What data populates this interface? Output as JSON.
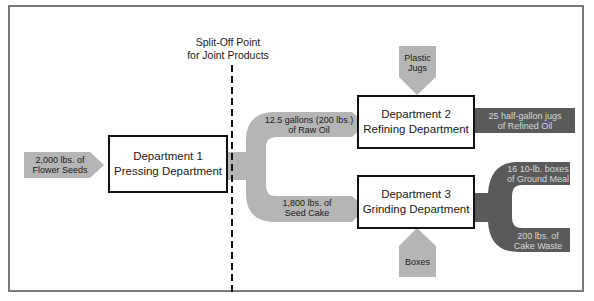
{
  "colors": {
    "light_flow": "#b5b5b5",
    "dark_flow": "#5a5a5a",
    "box_border": "#111111",
    "frame": "#7a7a7a"
  },
  "split_off": {
    "line1": "Split-Off Point",
    "line2": "for Joint Products"
  },
  "departments": [
    {
      "line1": "Department 1",
      "line2": "Pressing Department"
    },
    {
      "line1": "Department 2",
      "line2": "Refining Department"
    },
    {
      "line1": "Department 3",
      "line2": "Grinding Department"
    }
  ],
  "inputs": {
    "raw_material": {
      "line1": "2,000 lbs. of",
      "line2": "Flower Seeds"
    },
    "plastic_jugs": {
      "line1": "Plastic",
      "line2": "Jugs"
    },
    "boxes": {
      "line1": "Boxes"
    }
  },
  "joint_products": {
    "raw_oil": {
      "line1": "12.5 gallons (200 lbs.)",
      "line2": "of Raw Oil"
    },
    "seed_cake": {
      "line1": "1,800 lbs. of",
      "line2": "Seed Cake"
    }
  },
  "outputs": {
    "refined_oil": {
      "line1": "25 half-gallon jugs",
      "line2": "of Refined Oil"
    },
    "ground_meal": {
      "line1": "16 10-lb. boxes",
      "line2": "of Ground Meal"
    },
    "cake_waste": {
      "line1": "200 lbs. of",
      "line2": "Cake Waste"
    }
  }
}
